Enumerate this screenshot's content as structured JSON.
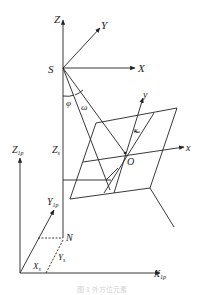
{
  "diagram": {
    "type": "photogrammetry-coordinate-systems",
    "labels": {
      "Z_upper": "Z",
      "Y_upper": "Y",
      "X_upper": "X",
      "S": "S",
      "phi": "φ",
      "omega": "ω",
      "y_image": "y",
      "kappa": "κ",
      "x_image": "x",
      "O": "O",
      "Zs_main": "Z",
      "Zs_sub": "s",
      "Z1p_main": "Z",
      "Z1p_sub": "1p",
      "Y1p_main": "Y",
      "Y1p_sub": "1p",
      "N": "N",
      "Ys_main": "Y",
      "Ys_sub": "s",
      "Xs_main": "X",
      "Xs_sub": "s",
      "X1p_main": "X",
      "X1p_sub": "1p"
    },
    "caption": "图 1   外方位元素"
  },
  "colors": {
    "line": "#222222",
    "background": "#ffffff"
  }
}
